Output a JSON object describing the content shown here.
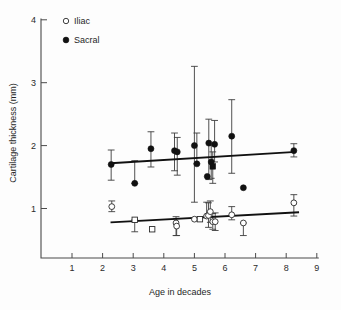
{
  "chart_data": {
    "type": "scatter",
    "title": "",
    "xlabel": "Age in decades",
    "ylabel": "Cartilage thickness (mm)",
    "xlim": [
      0.0,
      9.4
    ],
    "ylim": [
      0.2,
      4.0
    ],
    "xticks": [
      1,
      2,
      3,
      4,
      5,
      6,
      7,
      8,
      9
    ],
    "yticks": [
      1,
      2,
      3,
      4
    ],
    "grid": false,
    "legend_position": "top-left",
    "legend": [
      {
        "label": "Iliac",
        "marker": "open-circle"
      },
      {
        "label": "Sacral",
        "marker": "filled-circle"
      }
    ],
    "series": [
      {
        "name": "Sacral",
        "marker": "filled-circle",
        "points": [
          {
            "x": 2.28,
            "y": 1.7,
            "lo": 1.45,
            "hi": 1.93,
            "marker": "filled-circle"
          },
          {
            "x": 3.05,
            "y": 1.4,
            "lo": 1.4,
            "hi": 1.76,
            "marker": "filled-circle"
          },
          {
            "x": 3.58,
            "y": 1.95,
            "lo": 1.66,
            "hi": 2.22,
            "marker": "filled-circle"
          },
          {
            "x": 4.35,
            "y": 1.92,
            "lo": 1.6,
            "hi": 2.2,
            "marker": "filled-circle"
          },
          {
            "x": 4.44,
            "y": 1.9,
            "lo": 1.53,
            "hi": 2.13,
            "marker": "filled-circle"
          },
          {
            "x": 5.0,
            "y": 2.0,
            "lo": 1.1,
            "hi": 3.26,
            "marker": "filled-circle"
          },
          {
            "x": 5.08,
            "y": 1.71,
            "lo": 1.71,
            "hi": 2.2,
            "marker": "filled-circle"
          },
          {
            "x": 5.42,
            "y": 1.51,
            "lo": 1.51,
            "hi": 1.51,
            "marker": "filled-circle"
          },
          {
            "x": 5.47,
            "y": 2.04,
            "lo": 1.46,
            "hi": 2.42,
            "marker": "filled-circle"
          },
          {
            "x": 5.55,
            "y": 1.74,
            "lo": 1.48,
            "hi": 2.0,
            "marker": "filled-circle"
          },
          {
            "x": 5.6,
            "y": 1.67,
            "lo": 1.4,
            "hi": 1.9,
            "marker": "filled-square"
          },
          {
            "x": 5.66,
            "y": 2.02,
            "lo": 1.74,
            "hi": 2.4,
            "marker": "filled-circle"
          },
          {
            "x": 6.22,
            "y": 2.15,
            "lo": 1.56,
            "hi": 2.73,
            "marker": "filled-circle"
          },
          {
            "x": 6.6,
            "y": 1.33,
            "lo": 1.33,
            "hi": 1.33,
            "marker": "filled-circle"
          },
          {
            "x": 8.25,
            "y": 1.92,
            "lo": 1.82,
            "hi": 2.03,
            "marker": "filled-circle"
          }
        ],
        "trend_line": {
          "x1": 2.26,
          "y1": 1.72,
          "x2": 8.32,
          "y2": 1.9
        }
      },
      {
        "name": "Iliac",
        "marker": "open-circle",
        "points": [
          {
            "x": 2.3,
            "y": 1.03,
            "lo": 0.95,
            "hi": 1.12,
            "marker": "open-circle"
          },
          {
            "x": 3.05,
            "y": 0.82,
            "lo": 0.63,
            "hi": 0.82,
            "marker": "open-square"
          },
          {
            "x": 3.62,
            "y": 0.67,
            "lo": 0.67,
            "hi": 0.67,
            "marker": "open-square"
          },
          {
            "x": 4.4,
            "y": 0.77,
            "lo": 0.57,
            "hi": 0.87,
            "marker": "open-circle"
          },
          {
            "x": 4.42,
            "y": 0.72,
            "lo": 0.57,
            "hi": 0.84,
            "marker": "open-circle"
          },
          {
            "x": 5.0,
            "y": 0.83,
            "lo": 0.83,
            "hi": 0.83,
            "marker": "open-circle"
          },
          {
            "x": 5.18,
            "y": 0.83,
            "lo": 0.83,
            "hi": 0.83,
            "marker": "open-square"
          },
          {
            "x": 5.4,
            "y": 0.88,
            "lo": 0.88,
            "hi": 1.1,
            "marker": "open-circle"
          },
          {
            "x": 5.46,
            "y": 0.89,
            "lo": 0.7,
            "hi": 1.09,
            "marker": "open-circle"
          },
          {
            "x": 5.52,
            "y": 0.95,
            "lo": 0.78,
            "hi": 1.12,
            "marker": "open-circle"
          },
          {
            "x": 5.6,
            "y": 0.79,
            "lo": 0.67,
            "hi": 0.92,
            "marker": "open-circle"
          },
          {
            "x": 5.68,
            "y": 0.79,
            "lo": 0.65,
            "hi": 0.93,
            "marker": "open-circle"
          },
          {
            "x": 6.22,
            "y": 0.9,
            "lo": 0.82,
            "hi": 1.03,
            "marker": "open-circle"
          },
          {
            "x": 6.6,
            "y": 0.77,
            "lo": 0.57,
            "hi": 0.77,
            "marker": "open-circle"
          },
          {
            "x": 8.25,
            "y": 1.09,
            "lo": 0.88,
            "hi": 1.22,
            "marker": "open-circle"
          }
        ],
        "trend_line": {
          "x1": 2.26,
          "y1": 0.78,
          "x2": 8.42,
          "y2": 0.94
        }
      }
    ]
  },
  "colors": {
    "axis": "#4a4a4a",
    "sacral": "#111111",
    "iliac_fill": "#ffffff",
    "iliac_stroke": "#2a2a2a",
    "trend": "#111111",
    "background": "#fdfdfd"
  }
}
